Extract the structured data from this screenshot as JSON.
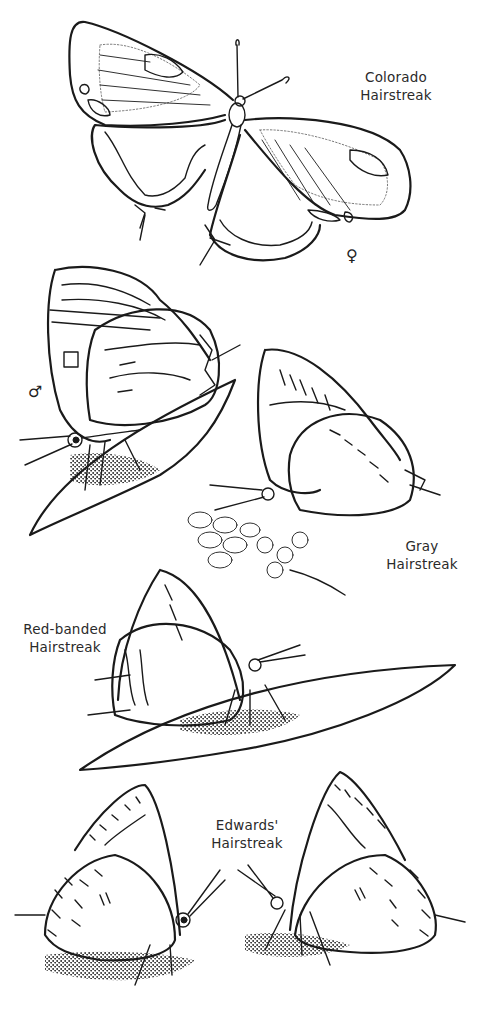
{
  "page": {
    "background": "#ffffff",
    "ink_color": "#1a1a1a",
    "style": "black line-art illustration of hairstreak butterflies"
  },
  "figures": [
    {
      "id": "colorado",
      "label_line1": "Colorado",
      "label_line2": "Hairstreak",
      "sex_symbol": "♀",
      "pose": "wings open, dorsal view"
    },
    {
      "id": "colorado-male",
      "sex_symbol": "♂",
      "pose": "wings closed, perched on leaf"
    },
    {
      "id": "gray",
      "label_line1": "Gray",
      "label_line2": "Hairstreak",
      "pose": "wings closed, perched on flower cluster"
    },
    {
      "id": "red-banded",
      "label_line1": "Red-banded",
      "label_line2": "Hairstreak",
      "pose": "wings closed, perched on leaf"
    },
    {
      "id": "edwards",
      "label_line1": "Edwards'",
      "label_line2": "Hairstreak",
      "pose": "two individuals facing each other, wings closed"
    }
  ]
}
